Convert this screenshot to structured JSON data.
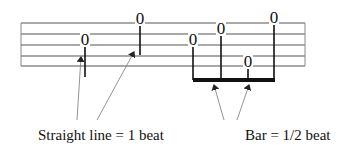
{
  "diagram": {
    "staff": {
      "x_start": 21,
      "x_end": 305,
      "lines_y": [
        23,
        34,
        45,
        56,
        66
      ],
      "line_color": "#555555"
    },
    "notes": [
      {
        "label": "0",
        "x": 85,
        "y": 39,
        "stem_end": 77,
        "type": "quarter"
      },
      {
        "label": "0",
        "x": 140,
        "y": 18,
        "stem_end": 55,
        "type": "quarter"
      },
      {
        "label": "0",
        "x": 193,
        "y": 39,
        "stem_end": 80,
        "type": "eighth"
      },
      {
        "label": "0",
        "x": 221,
        "y": 28,
        "stem_end": 80,
        "type": "eighth"
      },
      {
        "label": "0",
        "x": 248,
        "y": 61,
        "stem_end": 80,
        "type": "eighth"
      },
      {
        "label": "0",
        "x": 274,
        "y": 17,
        "stem_end": 80,
        "type": "eighth"
      }
    ],
    "beam": {
      "x1": 193,
      "x2": 275,
      "y": 78,
      "height": 4,
      "color": "#111111"
    },
    "arrows": [
      {
        "from": [
          77,
          120
        ],
        "to": [
          81,
          57
        ]
      },
      {
        "from": [
          97,
          120
        ],
        "to": [
          134,
          52
        ]
      },
      {
        "from": [
          224,
          120
        ],
        "to": [
          214,
          85
        ]
      },
      {
        "from": [
          237,
          120
        ],
        "to": [
          249,
          85
        ]
      }
    ],
    "captions": {
      "left": "Straight line = 1 beat",
      "right": "Bar = 1/2 beat"
    }
  }
}
